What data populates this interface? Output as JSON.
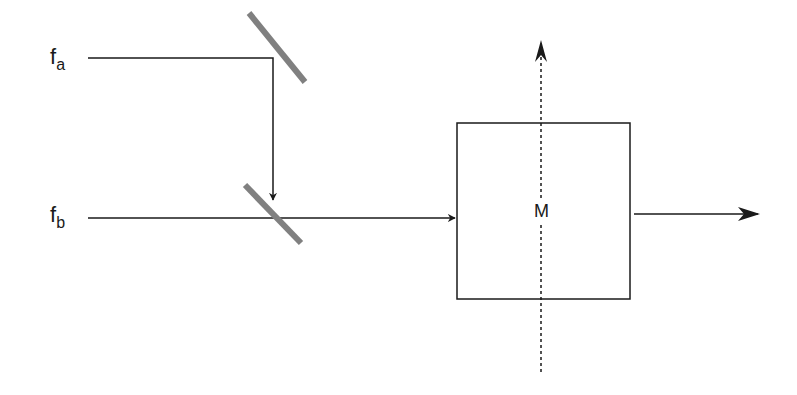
{
  "diagram": {
    "inputs": [
      {
        "id": "fa",
        "main": "f",
        "sub": "a"
      },
      {
        "id": "fb",
        "main": "f",
        "sub": "b"
      }
    ],
    "box": {
      "label": "M"
    },
    "colors": {
      "line": "#1a1a1a",
      "mirror": "#808080",
      "background": "#ffffff"
    }
  }
}
